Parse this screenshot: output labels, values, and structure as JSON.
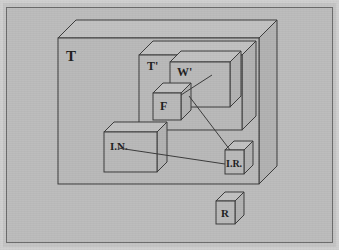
{
  "figure": {
    "kind": "isometric-nested-block-diagram",
    "background_color": "#bcbcbc",
    "line_color": "#3a3a3a",
    "paper_border_color": "#cfcfcf",
    "blocks": [
      {
        "id": "T",
        "label": "T",
        "role": "outermost-slab"
      },
      {
        "id": "Tp",
        "label": "T'",
        "role": "inner-slab"
      },
      {
        "id": "Wp",
        "label": "W'",
        "role": "inner-frame-slab"
      },
      {
        "id": "F",
        "label": "F",
        "role": "small-cube"
      },
      {
        "id": "IN",
        "label": "I.N.",
        "role": "flat-block"
      },
      {
        "id": "IR",
        "label": "I.R.",
        "role": "small-cube"
      },
      {
        "id": "R",
        "label": "R",
        "role": "small-cube-outside"
      }
    ],
    "connectors": [
      {
        "from": "Wp",
        "to": "F",
        "style": "straight-leader"
      },
      {
        "from": "F",
        "to": "IR",
        "style": "straight-leader"
      },
      {
        "from": "IN",
        "to": "IR",
        "style": "straight-leader"
      }
    ]
  },
  "labels": {
    "T": "T",
    "Tp": "T'",
    "Wp": "W'",
    "F": "F",
    "IN": "I.N.",
    "IR": "I.R.",
    "R": "R"
  }
}
